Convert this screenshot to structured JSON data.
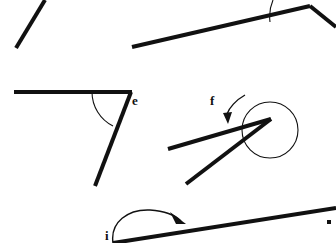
{
  "page": {
    "background_color": "#ffffff",
    "ink_color": "#111111",
    "width": 336,
    "height": 243
  },
  "labels": {
    "e": "e",
    "f": "f",
    "i": "i"
  },
  "figures": [
    {
      "id": "figure-top-left-segment",
      "name": "plain-line-segment",
      "description": "single diagonal line segment, upper-left",
      "points": [
        [
          16,
          48
        ],
        [
          45,
          0
        ]
      ]
    },
    {
      "id": "figure-top-right-angle",
      "name": "obtuse-angle-top-right",
      "description": "angle with vertex at right, long ray sloping down-left and short ray to lower-right, thin arc marking the angle",
      "vertex": [
        310,
        6
      ],
      "rays": [
        [
          132,
          47
        ],
        [
          336,
          27
        ]
      ],
      "arc_radius": 42
    },
    {
      "id": "figure-e",
      "name": "angle-e",
      "label": "e",
      "description": "angle with horizontal ray to the left and ray sloping down-left, arc marking interior angle",
      "vertex": [
        130,
        92
      ],
      "rays": [
        [
          14,
          92
        ],
        [
          95,
          186
        ]
      ],
      "arc_radius": 38
    },
    {
      "id": "figure-f",
      "name": "reflex-angle-f",
      "label": "f",
      "description": "narrow angle with vertex at right, two rays to the left, large circle and curved arrow marking the reflex angle",
      "vertex": [
        271,
        119
      ],
      "rays": [
        [
          168,
          149
        ],
        [
          186,
          184
        ]
      ],
      "circle_center": [
        270,
        130
      ],
      "circle_radius": 28
    },
    {
      "id": "figure-i",
      "name": "angle-i",
      "label": "i",
      "description": "line with a curved arrow arc above it at the bottom of the page",
      "points": [
        [
          113,
          243
        ],
        [
          336,
          209
        ]
      ],
      "arrow_tip": [
        184,
        222
      ]
    },
    {
      "id": "figure-bottom-right-mark",
      "name": "corner-tick-mark",
      "description": "small ink mark at lower-right edge",
      "point": [
        329,
        222
      ]
    }
  ]
}
